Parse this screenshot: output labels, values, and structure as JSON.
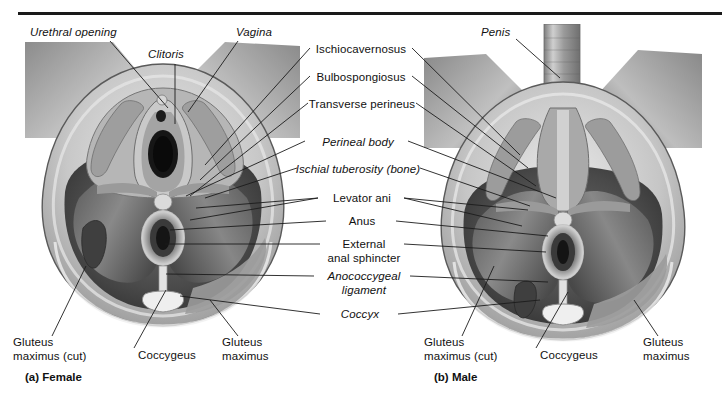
{
  "figure": {
    "title_rule": true,
    "captions": [
      {
        "name": "caption-female",
        "text": "(a) Female",
        "x": 25,
        "y": 371
      },
      {
        "name": "caption-male",
        "text": "(b) Male",
        "x": 434,
        "y": 371
      }
    ]
  },
  "labels": {
    "left_female": [
      {
        "name": "label-urethral-opening",
        "text": "Urethral opening",
        "italic": true,
        "x": 30,
        "y": 33,
        "align": "left"
      },
      {
        "name": "label-clitoris",
        "text": "Clitoris",
        "italic": true,
        "x": 148,
        "y": 55,
        "align": "left"
      },
      {
        "name": "label-vagina",
        "text": "Vagina",
        "italic": true,
        "x": 236,
        "y": 33,
        "align": "left"
      }
    ],
    "center": [
      {
        "name": "label-ischiocavernosus",
        "text": "Ischiocavernosus",
        "italic": false,
        "y": 44,
        "lines": 1
      },
      {
        "name": "label-bulbospongiosus",
        "text": "Bulbospongiosus",
        "italic": false,
        "y": 72,
        "lines": 1
      },
      {
        "name": "label-transverse-perineus",
        "text": "Transverse perineus",
        "italic": false,
        "y": 99,
        "lines": 1
      },
      {
        "name": "label-perineal-body",
        "text": "Perineal body",
        "italic": true,
        "y": 137,
        "lines": 1
      },
      {
        "name": "label-ischial-tuberosity",
        "text": "Ischial tuberosity (bone)",
        "italic": true,
        "y": 164,
        "lines": 1
      },
      {
        "name": "label-levator-ani",
        "text": "Levator ani",
        "italic": false,
        "y": 194,
        "lines": 1
      },
      {
        "name": "label-anus",
        "text": "Anus",
        "italic": false,
        "y": 217,
        "lines": 1
      },
      {
        "name": "label-external-anal-sphincter",
        "text": "External\nanal sphincter",
        "italic": false,
        "y": 240,
        "lines": 2
      },
      {
        "name": "label-anococcygeal-ligament",
        "text": "Anococcygeal\nligament",
        "italic": true,
        "y": 272,
        "lines": 2
      },
      {
        "name": "label-coccyx",
        "text": "Coccyx",
        "italic": true,
        "y": 310,
        "lines": 1
      }
    ],
    "right_male": [
      {
        "name": "label-penis",
        "text": "Penis",
        "italic": true,
        "x": 483,
        "y": 33,
        "align": "left"
      }
    ],
    "bottom_female": [
      {
        "name": "label-gluteus-maximus-cut-female",
        "text": "Gluteus\nmaximus (cut)",
        "x": 13,
        "y": 340,
        "align": "left"
      },
      {
        "name": "label-coccygeus-female",
        "text": "Coccygeus",
        "x": 138,
        "y": 352,
        "align": "left"
      },
      {
        "name": "label-gluteus-maximus-female",
        "text": "Gluteus\nmaximus",
        "x": 222,
        "y": 340,
        "align": "left"
      }
    ],
    "bottom_male": [
      {
        "name": "label-gluteus-maximus-cut-male",
        "text": "Gluteus\nmaximus (cut)",
        "x": 425,
        "y": 340,
        "align": "left"
      },
      {
        "name": "label-coccygeus-male",
        "text": "Coccygeus",
        "x": 540,
        "y": 352,
        "align": "left"
      },
      {
        "name": "label-gluteus-maximus-male",
        "text": "Gluteus\nmaximus",
        "x": 643,
        "y": 340,
        "align": "left"
      }
    ]
  },
  "colors": {
    "rule": "#1a1a1a",
    "text": "#111111",
    "leader": "#1c1c1c",
    "background": "#ffffff"
  }
}
